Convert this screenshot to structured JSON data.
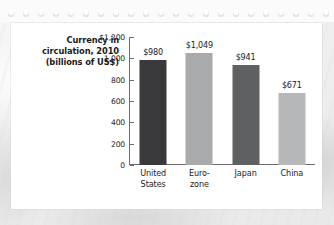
{
  "card": {
    "title_lines": [
      "Currency in",
      "circulation, 2010",
      "(billions of US$)"
    ]
  },
  "chart_data": {
    "type": "bar",
    "title": "Currency in circulation, 2010 (billions of US$)",
    "xlabel": "",
    "ylabel": "",
    "ylim": [
      0,
      1200
    ],
    "grid": false,
    "legend": "none",
    "categories": [
      "United States",
      "Euro-zone",
      "Japan",
      "China"
    ],
    "category_label_lines": [
      [
        "United",
        "States"
      ],
      [
        "Euro-",
        "zone"
      ],
      [
        "Japan"
      ],
      [
        "China"
      ]
    ],
    "values": [
      980,
      1049,
      941,
      671
    ],
    "value_labels": [
      "$980",
      "$1,049",
      "$941",
      "$671"
    ],
    "bar_colors": [
      "#3a3a3c",
      "#a8aaac",
      "#5e6062",
      "#b5b7b9"
    ],
    "y_ticks": [
      1200,
      1000,
      800,
      600,
      400,
      200,
      0
    ],
    "y_tick_labels": [
      "$1,200",
      "1,000",
      "800",
      "600",
      "400",
      "200",
      "0"
    ]
  },
  "colors": {
    "axis": "#6d6d6d",
    "text": "#1b1b1b",
    "card_background": "#ffffff",
    "page_background": "#efefef"
  }
}
